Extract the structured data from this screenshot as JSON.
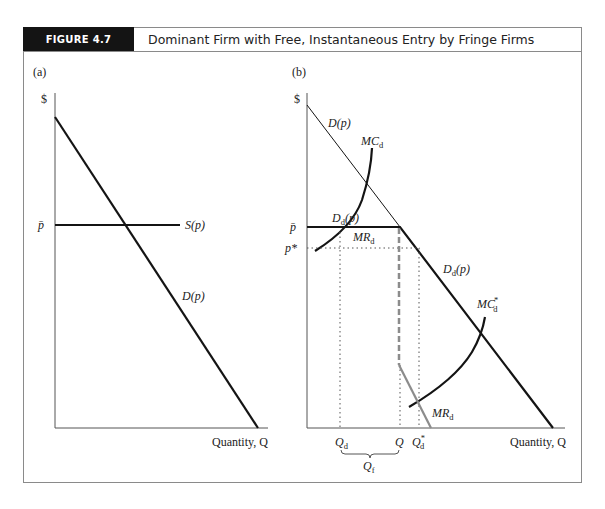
{
  "figure": {
    "tag": "FIGURE 4.7",
    "title": "Dominant Firm with Free, Instantaneous Entry by Fringe Firms"
  },
  "panels": {
    "a": {
      "label": "(a)",
      "y_axis": "$",
      "x_axis": "Quantity, Q",
      "price_tick": "p̄",
      "curves": {
        "supply": "S(p)",
        "demand": "D(p)"
      }
    },
    "b": {
      "label": "(b)",
      "y_axis": "$",
      "x_axis": "Quantity, Q",
      "price_ticks": {
        "pbar": "p̄",
        "pstar": "p*"
      },
      "curves": {
        "demand": "D(p)",
        "mc": "MC",
        "mc_sub": "d",
        "residual_demand": "D",
        "residual_demand_sub": "d",
        "residual_demand_arg": "(p)",
        "mr_upper": "MR",
        "mr_upper_sub": "d",
        "mc_star": "MC",
        "mc_star_sub": "d",
        "mc_star_sup": "*",
        "mr_lower": "MR",
        "mr_lower_sub": "d"
      },
      "quantity_ticks": {
        "qd": "Q",
        "qd_sub": "d",
        "q": "Q",
        "qdstar": "Q",
        "qdstar_sub": "d",
        "qdstar_sup": "*",
        "qf": "Q",
        "qf_sub": "f"
      }
    }
  },
  "colors": {
    "line": "#141414",
    "gray_line": "#8c8c8c",
    "dotted": "#555555"
  }
}
